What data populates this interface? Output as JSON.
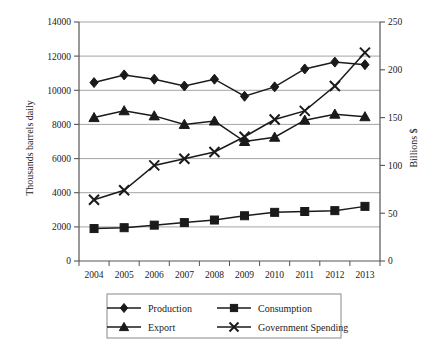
{
  "chart_data": {
    "type": "line",
    "title": "",
    "xlabel": "",
    "ylabel": "Thousands barrels daily",
    "y2label": "Billions $",
    "grid": true,
    "legend_position": "bottom",
    "categories": [
      "2004",
      "2005",
      "2006",
      "2007",
      "2008",
      "2009",
      "2010",
      "2011",
      "2012",
      "2013"
    ],
    "ylim": [
      0,
      14000
    ],
    "y2lim": [
      0,
      250
    ],
    "yticks": [
      "0",
      "2000",
      "4000",
      "6000",
      "8000",
      "10000",
      "12000",
      "14000"
    ],
    "ytick_values": [
      0,
      2000,
      4000,
      6000,
      8000,
      10000,
      12000,
      14000
    ],
    "y2ticks": [
      "0",
      "50",
      "100",
      "150",
      "200",
      "250"
    ],
    "y2tick_values": [
      0,
      50,
      100,
      150,
      200,
      250
    ],
    "series": [
      {
        "name": "Production",
        "marker": "diamond",
        "axis": "left",
        "values": [
          10450,
          10900,
          10650,
          10250,
          10650,
          9650,
          10200,
          11250,
          11650,
          11500
        ]
      },
      {
        "name": "Consumption",
        "marker": "square",
        "axis": "left",
        "values": [
          1900,
          1950,
          2100,
          2250,
          2400,
          2650,
          2850,
          2900,
          2950,
          3200
        ]
      },
      {
        "name": "Export",
        "marker": "triangle",
        "axis": "left",
        "values": [
          8400,
          8800,
          8500,
          8000,
          8200,
          7000,
          7250,
          8250,
          8600,
          8450
        ]
      },
      {
        "name": "Government Spending",
        "marker": "cross",
        "axis": "right",
        "values": [
          64,
          74,
          100,
          107,
          114,
          130,
          148,
          157,
          183,
          218
        ]
      }
    ]
  },
  "legend": {
    "items": [
      {
        "label": "Production",
        "marker": "diamond"
      },
      {
        "label": "Consumption",
        "marker": "square"
      },
      {
        "label": "Export",
        "marker": "triangle"
      },
      {
        "label": "Government Spending",
        "marker": "cross"
      }
    ]
  },
  "colors": {
    "series_line": "#1a1a1a",
    "grid": "#9a9a9a",
    "axis": "#555555",
    "background": "#ffffff",
    "legend_border": "#888888"
  }
}
